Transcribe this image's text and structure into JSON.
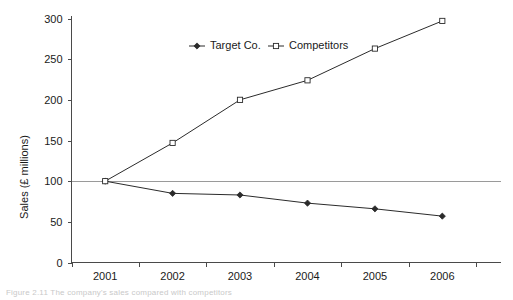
{
  "chart_data": {
    "type": "line",
    "title": "",
    "xlabel": "",
    "ylabel": "Sales (£ millions)",
    "categories": [
      "2001",
      "2002",
      "2003",
      "2004",
      "2005",
      "2006"
    ],
    "x": [
      2001,
      2002,
      2003,
      2004,
      2005,
      2006
    ],
    "ylim": [
      0,
      300
    ],
    "yticks": [
      0,
      50,
      100,
      150,
      200,
      250,
      300
    ],
    "ytick_labels": [
      "0",
      "50",
      "100",
      "150",
      "200",
      "250",
      "300"
    ],
    "grid": false,
    "legend_position": "top-center",
    "reference_line": {
      "value": 100,
      "style": "solid-light",
      "color": "#9a9a9a"
    },
    "series": [
      {
        "name": "Target Co.",
        "marker": "filled-diamond",
        "color": "#2b2b2b",
        "values": [
          100,
          85,
          83,
          73,
          66,
          57
        ]
      },
      {
        "name": "Competitors",
        "marker": "open-square",
        "color": "#2b2b2b",
        "values": [
          100,
          147,
          200,
          224,
          263,
          297
        ]
      }
    ]
  },
  "legend": {
    "items": [
      {
        "label": "Target Co."
      },
      {
        "label": "Competitors"
      }
    ]
  },
  "axes": {
    "y_title": "Sales (£ millions)"
  },
  "caption": {
    "text": "Figure 2.11  The company's sales compared with competitors"
  },
  "colors": {
    "axis": "#4a4a4a",
    "series": "#2b2b2b",
    "reference": "#9a9a9a",
    "text": "#1a1a1a",
    "background": "#ffffff"
  }
}
